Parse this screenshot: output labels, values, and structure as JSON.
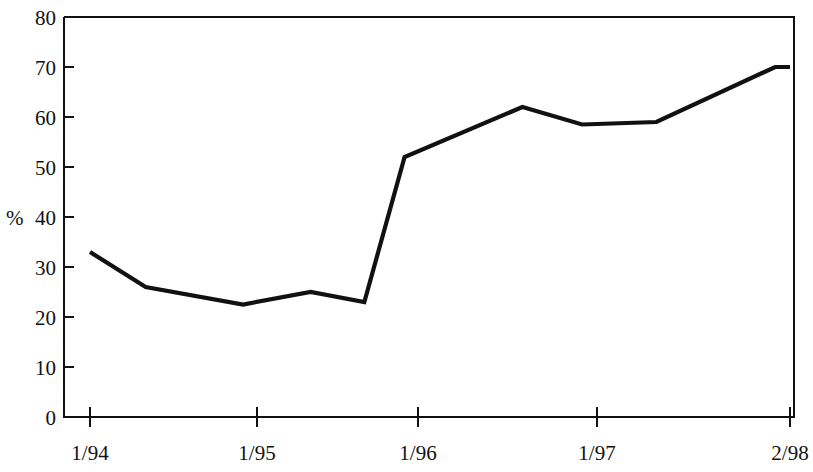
{
  "chart_data": {
    "type": "line",
    "title": "",
    "subtitle": "",
    "xlabel": "",
    "ylabel": "%",
    "ylim": [
      0,
      80
    ],
    "grid": false,
    "legend": null,
    "y_ticks": [
      0,
      10,
      20,
      30,
      40,
      50,
      60,
      70,
      80
    ],
    "y_tick_labels": [
      "0",
      "10",
      "20",
      "30",
      "40",
      "50",
      "60",
      "70",
      "80"
    ],
    "x_tick_labels": [
      "1/94",
      "1/95",
      "1/96",
      "1/97",
      "2/98"
    ],
    "x_tick_values": [
      "1/94",
      "1/95",
      "1/96",
      "1/97",
      "2/98"
    ],
    "x": [
      "1/94",
      "5/94",
      "12/94",
      "5/95",
      "9/95",
      "12/95",
      "8/96",
      "12/96",
      "5/97",
      "1/98",
      "2/98"
    ],
    "values": [
      33,
      26,
      22.5,
      25,
      23,
      52,
      62,
      58.5,
      59,
      70,
      70
    ],
    "series": [
      {
        "name": "series-1",
        "color": "#111111",
        "points": [
          {
            "x": "1/94",
            "y": 33
          },
          {
            "x": "5/94",
            "y": 26
          },
          {
            "x": "12/94",
            "y": 22.5
          },
          {
            "x": "5/95",
            "y": 25
          },
          {
            "x": "9/95",
            "y": 23
          },
          {
            "x": "12/95",
            "y": 52
          },
          {
            "x": "8/96",
            "y": 62
          },
          {
            "x": "12/96",
            "y": 58.5
          },
          {
            "x": "5/97",
            "y": 59
          },
          {
            "x": "1/98",
            "y": 70
          },
          {
            "x": "2/98",
            "y": 70
          }
        ]
      }
    ]
  },
  "axes": {
    "y_axis_title": "%",
    "y_labels": [
      "80",
      "70",
      "60",
      "50",
      "40",
      "30",
      "20",
      "10",
      "0"
    ],
    "x_labels": [
      "1/94",
      "1/95",
      "1/96",
      "1/97",
      "2/98"
    ]
  },
  "colors": {
    "line": "#111111",
    "axis": "#111111",
    "background": "#ffffff"
  }
}
